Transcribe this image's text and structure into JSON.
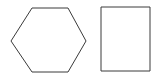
{
  "canvas": {
    "width": 160,
    "height": 77,
    "background_color": "#ffffff"
  },
  "style": {
    "stroke_color": "#3a3a3a",
    "stroke_width": 1,
    "fill": "none"
  },
  "shapes": [
    {
      "name": "hexagon",
      "label": "hexagon",
      "type": "polygon",
      "sides": 6,
      "orientation": "flat-top",
      "fill": "none",
      "stroke_color": "#3a3a3a",
      "stroke_width": 1,
      "points": "11,41 32,8 68,8 86,41 68,72 32,72",
      "bounds": {
        "x": 11,
        "y": 8,
        "width": 75,
        "height": 64
      }
    },
    {
      "name": "rectangle",
      "label": "rectangle",
      "type": "rect",
      "sides": 4,
      "orientation": "portrait",
      "fill": "none",
      "stroke_color": "#3a3a3a",
      "stroke_width": 1,
      "points": "101,7 150,7 150,71 101,71",
      "bounds": {
        "x": 101,
        "y": 7,
        "width": 49,
        "height": 64
      }
    }
  ]
}
